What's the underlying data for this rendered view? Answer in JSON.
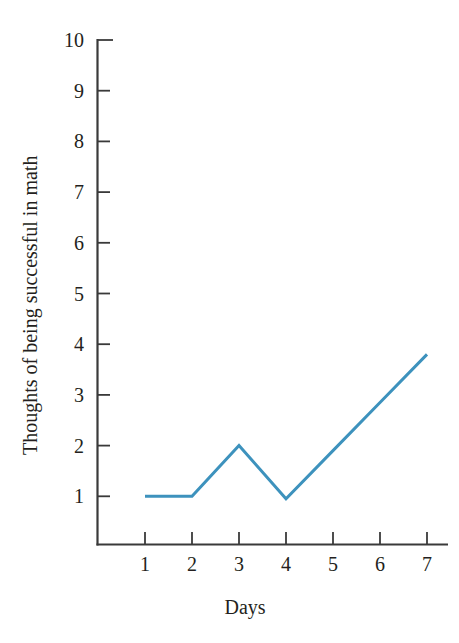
{
  "chart_data": {
    "type": "line",
    "title": "",
    "subtitle": "",
    "xlabel": "Days",
    "ylabel": "Thoughts of being successful in math",
    "x": [
      1,
      2,
      3,
      4,
      5,
      6,
      7
    ],
    "values": [
      1.0,
      1.0,
      2.0,
      0.95,
      1.9,
      2.85,
      3.8
    ],
    "series": [
      {
        "name": "Thoughts of being successful in math",
        "color": "#3d92bd",
        "values": [
          1.0,
          1.0,
          2.0,
          0.95,
          1.9,
          2.85,
          3.8
        ]
      }
    ],
    "xlim": [
      0.45,
      7.0
    ],
    "ylim": [
      0.0,
      10.0
    ],
    "x_tick_labels": [
      "1",
      "2",
      "3",
      "4",
      "5",
      "6",
      "7"
    ],
    "y_tick_labels": [
      "1",
      "2",
      "3",
      "4",
      "5",
      "6",
      "7",
      "8",
      "9",
      "10"
    ],
    "y_ticks": [
      1,
      2,
      3,
      4,
      5,
      6,
      7,
      8,
      9,
      10
    ],
    "grid": false,
    "legend": false,
    "legend_position": "none",
    "line_color": "#3d92bd",
    "line_width": 3,
    "axis_color": "#3a3a3a",
    "background_color": "#ffffff",
    "markers": false,
    "tick_direction": "in"
  },
  "axes": {
    "x_title": "Days",
    "y_title": "Thoughts of being successful in math"
  }
}
